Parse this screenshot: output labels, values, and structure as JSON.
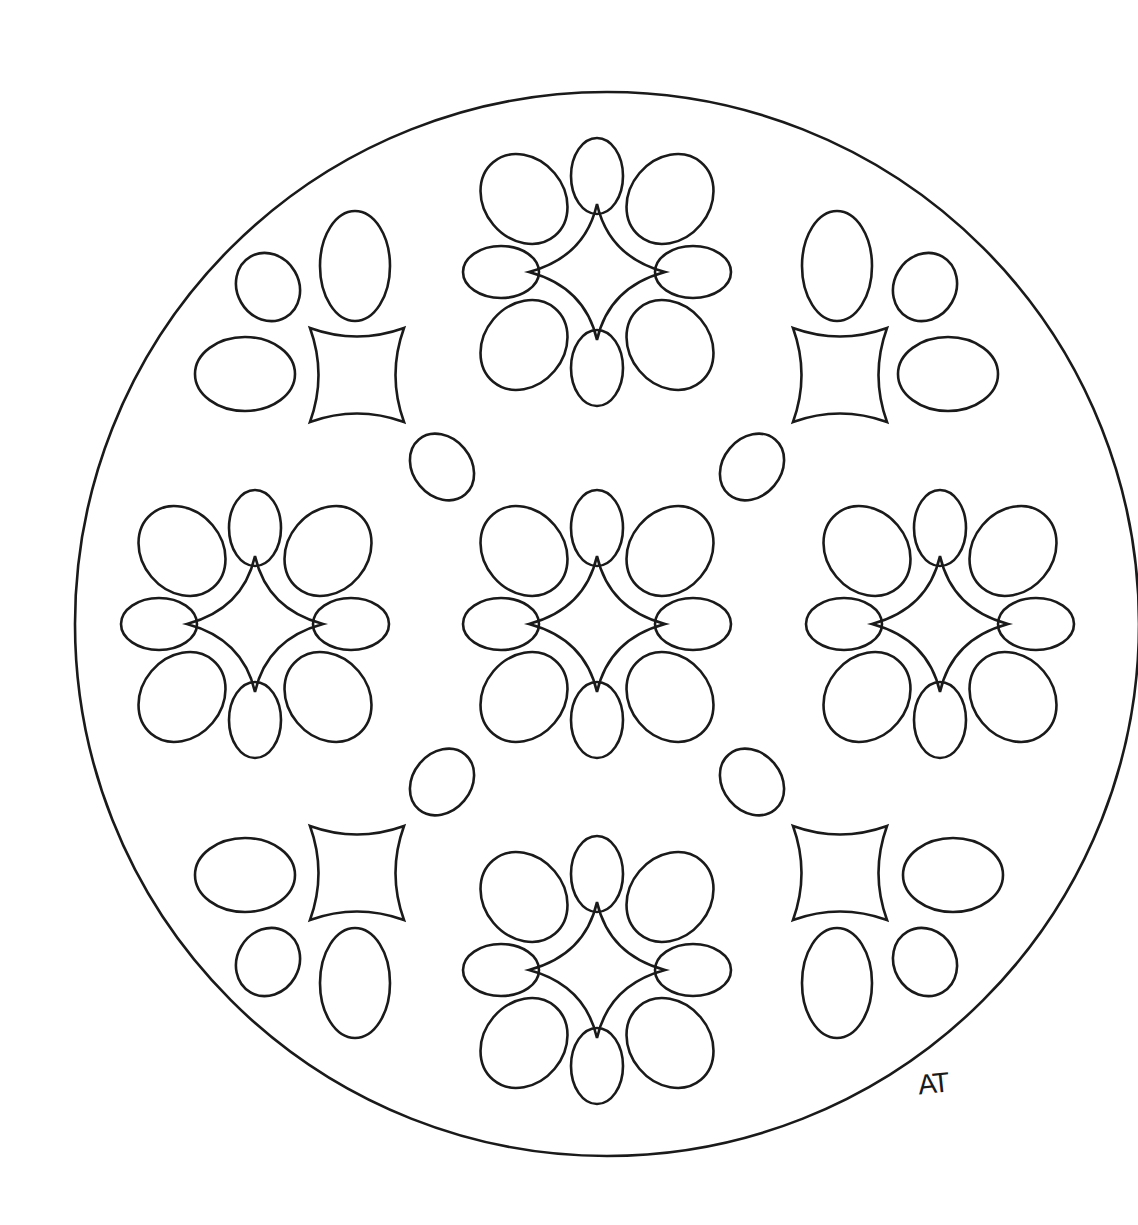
{
  "artwork": {
    "type": "mandala coloring page",
    "signature": "AT",
    "stroke_color": "#1a1a1a",
    "background": "#ffffff",
    "outer_circle": {
      "cx": 607,
      "cy": 624,
      "r": 532
    }
  }
}
